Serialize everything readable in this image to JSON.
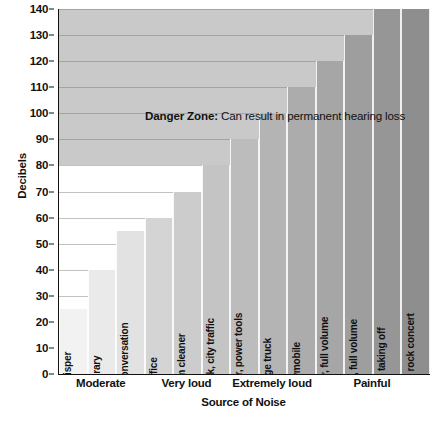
{
  "chart_data": {
    "type": "bar",
    "title": "",
    "xlabel": "Source of Noise",
    "ylabel": "Decibels",
    "ylim": [
      0,
      140
    ],
    "ytick_step": 10,
    "yticks": [
      0,
      10,
      20,
      30,
      40,
      50,
      60,
      70,
      80,
      90,
      100,
      110,
      120,
      130,
      140
    ],
    "grid": true,
    "legend": "none",
    "categories": [
      "whisper",
      "library",
      "normal conversation",
      "office",
      "vacuum cleaner",
      "alarm clock, city traffic",
      "lawn mower, power tools",
      "garbage truck",
      "snowmobile",
      "MP3 player, full volume",
      "car stereo, full volume",
      "jet plane taking off",
      "front row at rock concert"
    ],
    "values": [
      25,
      40,
      55,
      60,
      70,
      80,
      90,
      100,
      110,
      120,
      130,
      140,
      140
    ],
    "bar_colors": [
      "#f2f2f2",
      "#eaeaea",
      "#e2e2e2",
      "#d4d4d4",
      "#cccccc",
      "#c4c4c4",
      "#bcbcbc",
      "#b4b4b4",
      "#acacac",
      "#a6a6a6",
      "#9e9e9e",
      "#969696",
      "#8e8e8e"
    ],
    "groups": [
      {
        "label": "Moderate",
        "span": 3
      },
      {
        "label": "Very loud",
        "span": 3
      },
      {
        "label": "Extremely loud",
        "span": 3
      },
      {
        "label": "Painful",
        "span": 4
      }
    ],
    "annotations": [
      {
        "name": "danger-zone",
        "bold_text": "Danger Zone:",
        "text": " Can result in permanent hearing loss",
        "threshold": 80,
        "band_color": "#c9c9c9",
        "band_range": [
          80,
          140
        ]
      }
    ],
    "axis_color": "#111111",
    "grid_color": "#8c8c8c",
    "plot_background": "#ffffff"
  }
}
